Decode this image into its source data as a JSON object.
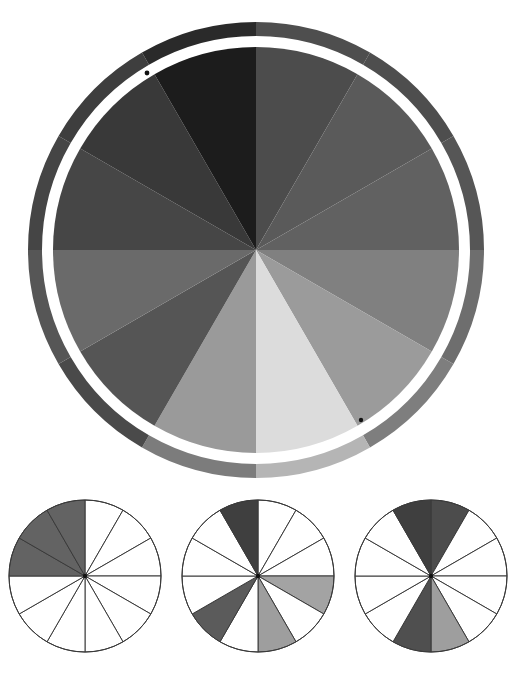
{
  "page": {
    "background_color": "#ffffff",
    "width": 517,
    "height": 689
  },
  "main_wheel": {
    "name": "value-wheel",
    "center": {
      "x": 256,
      "y": 250
    },
    "outer_rim_radius": 228,
    "rim_inner_radius": 214,
    "gap_outer_radius": 213,
    "gap_inner_radius": 206,
    "thin_ring_radius": 205,
    "pie_radius": 203,
    "sector_count": 12,
    "sector_angle_deg": 30,
    "start_angle_deg": -90,
    "separator_color": "#ffffff",
    "thin_ring_color": "#ffffff",
    "sectors": [
      {
        "index": 0,
        "label": "sector-1",
        "angle_start": -90,
        "angle_end": -60,
        "color": "#4c4c4c",
        "rim_color": "#4e4e4e",
        "value_percent": 30
      },
      {
        "index": 1,
        "label": "sector-2",
        "angle_start": -60,
        "angle_end": -30,
        "color": "#5a5a5a",
        "rim_color": "#4e4e4e",
        "value_percent": 35
      },
      {
        "index": 2,
        "label": "sector-3",
        "angle_start": -30,
        "angle_end": 0,
        "color": "#616161",
        "rim_color": "#565656",
        "value_percent": 38
      },
      {
        "index": 3,
        "label": "sector-4",
        "angle_start": 0,
        "angle_end": 30,
        "color": "#808080",
        "rim_color": "#6e6e6e",
        "value_percent": 50
      },
      {
        "index": 4,
        "label": "sector-5",
        "angle_start": 30,
        "angle_end": 60,
        "color": "#9b9b9b",
        "rim_color": "#7e7e7e",
        "value_percent": 61
      },
      {
        "index": 5,
        "label": "sector-6",
        "angle_start": 60,
        "angle_end": 90,
        "color": "#dcdcdc",
        "rim_color": "#b5b5b5",
        "value_percent": 86
      },
      {
        "index": 6,
        "label": "sector-7",
        "angle_start": 90,
        "angle_end": 120,
        "color": "#9a9a9a",
        "rim_color": "#7c7c7c",
        "value_percent": 60
      },
      {
        "index": 7,
        "label": "sector-8",
        "angle_start": 120,
        "angle_end": 150,
        "color": "#555555",
        "rim_color": "#4a4a4a",
        "value_percent": 33
      },
      {
        "index": 8,
        "label": "sector-9",
        "angle_start": 150,
        "angle_end": 180,
        "color": "#6a6a6a",
        "rim_color": "#565656",
        "value_percent": 41
      },
      {
        "index": 9,
        "label": "sector-10",
        "angle_start": 180,
        "angle_end": 210,
        "color": "#464646",
        "rim_color": "#454545",
        "value_percent": 27
      },
      {
        "index": 10,
        "label": "sector-11",
        "angle_start": 210,
        "angle_end": 240,
        "color": "#393939",
        "rim_color": "#3e3e3e",
        "value_percent": 22
      },
      {
        "index": 11,
        "label": "sector-12",
        "angle_start": 240,
        "angle_end": 270,
        "color": "#1c1c1c",
        "rim_color": "#2a2a2a",
        "value_percent": 11
      }
    ],
    "markers": [
      {
        "name": "marker-dot-top-left",
        "x": 147,
        "y": 73,
        "r": 2.4,
        "color": "#111111"
      },
      {
        "name": "marker-dot-bottom-right",
        "x": 361,
        "y": 420,
        "r": 2.2,
        "color": "#111111"
      }
    ]
  },
  "small_pies": [
    {
      "name": "small-pie-1",
      "center": {
        "x": 85,
        "y": 576
      },
      "radius": 76,
      "sector_count": 12,
      "stroke_color": "#3a3a3a",
      "stroke_width": 1,
      "fills": [
        "#ffffff",
        "#ffffff",
        "#ffffff",
        "#ffffff",
        "#ffffff",
        "#ffffff",
        "#ffffff",
        "#ffffff",
        "#ffffff",
        "#636363",
        "#636363",
        "#636363"
      ]
    },
    {
      "name": "small-pie-2",
      "center": {
        "x": 258,
        "y": 576
      },
      "radius": 76,
      "sector_count": 12,
      "stroke_color": "#3a3a3a",
      "stroke_width": 1,
      "fills": [
        "#ffffff",
        "#ffffff",
        "#ffffff",
        "#a3a3a3",
        "#ffffff",
        "#9e9e9e",
        "#ffffff",
        "#5b5b5b",
        "#ffffff",
        "#ffffff",
        "#ffffff",
        "#3f3f3f"
      ]
    },
    {
      "name": "small-pie-3",
      "center": {
        "x": 431,
        "y": 576
      },
      "radius": 76,
      "sector_count": 12,
      "stroke_color": "#3a3a3a",
      "stroke_width": 1,
      "fills": [
        "#4c4c4c",
        "#ffffff",
        "#ffffff",
        "#ffffff",
        "#ffffff",
        "#9e9e9e",
        "#4f4f4f",
        "#ffffff",
        "#ffffff",
        "#ffffff",
        "#ffffff",
        "#3f3f3f"
      ]
    }
  ],
  "chart_data": {
    "type": "pie",
    "categories": [
      "1",
      "2",
      "3",
      "4",
      "5",
      "6",
      "7",
      "8",
      "9",
      "10",
      "11",
      "12"
    ],
    "values": [
      8.333,
      8.333,
      8.333,
      8.333,
      8.333,
      8.333,
      8.333,
      8.333,
      8.333,
      8.333,
      8.333,
      8.333
    ],
    "slice_colors": [
      "#4c4c4c",
      "#5a5a5a",
      "#616161",
      "#808080",
      "#9b9b9b",
      "#dcdcdc",
      "#9a9a9a",
      "#555555",
      "#6a6a6a",
      "#464646",
      "#393939",
      "#1c1c1c"
    ],
    "lightness_percent": [
      30,
      35,
      38,
      50,
      61,
      86,
      60,
      33,
      41,
      27,
      22,
      11
    ],
    "xlabel": "",
    "ylabel": "",
    "legend": "none",
    "grid": false
  }
}
